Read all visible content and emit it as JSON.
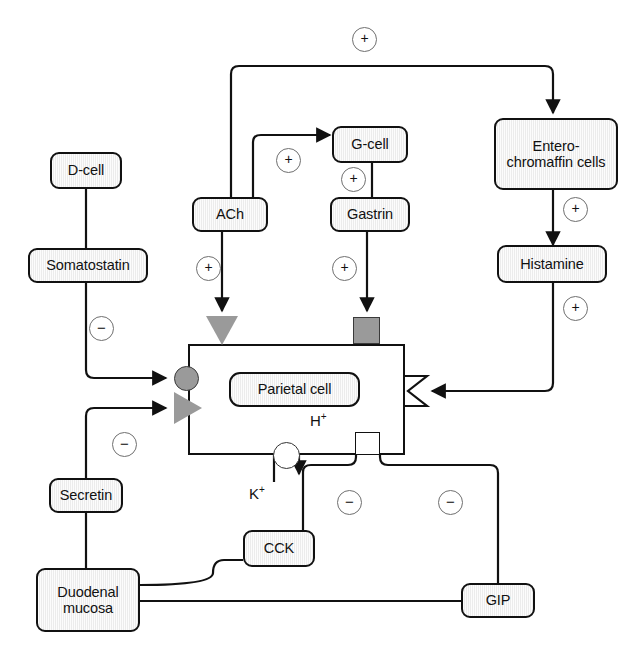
{
  "diagram": {
    "nodes": {
      "d_cell": "D-cell",
      "somatostatin": "Somatostatin",
      "ach": "ACh",
      "g_cell": "G-cell",
      "gastrin": "Gastrin",
      "enterochromaffin": "Entero-\nchromaffin cells",
      "enterochromaffin_line1": "Entero-",
      "enterochromaffin_line2": "chromaffin cells",
      "histamine": "Histamine",
      "parietal_cell": "Parietal cell",
      "secretin": "Secretin",
      "duodenal_line1": "Duodenal",
      "duodenal_line2": "mucosa",
      "cck": "CCK",
      "gip": "GIP"
    },
    "ions": {
      "hydrogen": "H",
      "hydrogen_charge": "+",
      "potassium": "K",
      "potassium_charge": "+"
    },
    "signs": {
      "plus": "+",
      "minus": "−"
    },
    "edges": [
      {
        "id": "ach-to-ec",
        "from": "ACh",
        "to": "Entero-chromaffin cells",
        "sign": "+"
      },
      {
        "id": "ach-to-gcell",
        "from": "ACh",
        "to": "G-cell",
        "sign": "+"
      },
      {
        "id": "gcell-to-gastrin",
        "from": "G-cell",
        "to": "Gastrin",
        "sign": "+"
      },
      {
        "id": "ach-to-parietal",
        "from": "ACh",
        "to": "Parietal cell",
        "sign": "+"
      },
      {
        "id": "gastrin-to-parietal",
        "from": "Gastrin",
        "to": "Parietal cell",
        "sign": "+"
      },
      {
        "id": "ec-to-histamine",
        "from": "Entero-chromaffin cells",
        "to": "Histamine",
        "sign": "+"
      },
      {
        "id": "histamine-to-parietal",
        "from": "Histamine",
        "to": "Parietal cell",
        "sign": "+"
      },
      {
        "id": "dcell-to-somatostatin",
        "from": "D-cell",
        "to": "Somatostatin",
        "sign": ""
      },
      {
        "id": "somatostatin-to-parietal",
        "from": "Somatostatin",
        "to": "Parietal cell",
        "sign": "−"
      },
      {
        "id": "secretin-to-parietal",
        "from": "Secretin",
        "to": "Parietal cell",
        "sign": "−"
      },
      {
        "id": "duodenum-to-secretin",
        "from": "Duodenal mucosa",
        "to": "Secretin",
        "sign": ""
      },
      {
        "id": "duodenum-to-cck",
        "from": "Duodenal mucosa",
        "to": "CCK",
        "sign": ""
      },
      {
        "id": "duodenum-to-gip",
        "from": "Duodenal mucosa",
        "to": "GIP",
        "sign": ""
      },
      {
        "id": "cck-to-pump",
        "from": "CCK",
        "to": "Parietal cell",
        "sign": "−"
      },
      {
        "id": "gip-to-pump",
        "from": "GIP",
        "to": "Parietal cell",
        "sign": "−"
      }
    ],
    "sign_markers": [
      {
        "id": "plus-top",
        "label": "+",
        "x": 352,
        "y": 27
      },
      {
        "id": "plus-ach-gcell",
        "label": "+",
        "x": 276,
        "y": 148
      },
      {
        "id": "plus-gcell-gast",
        "label": "+",
        "x": 341,
        "y": 167
      },
      {
        "id": "plus-ach-cell",
        "label": "+",
        "x": 196,
        "y": 256
      },
      {
        "id": "plus-gast-cell",
        "label": "+",
        "x": 332,
        "y": 256
      },
      {
        "id": "plus-ec-hist",
        "label": "+",
        "x": 563,
        "y": 197
      },
      {
        "id": "plus-hist-cell",
        "label": "+",
        "x": 563,
        "y": 296
      },
      {
        "id": "minus-somato",
        "label": "−",
        "x": 89,
        "y": 316
      },
      {
        "id": "minus-secretin",
        "label": "−",
        "x": 112,
        "y": 432
      },
      {
        "id": "minus-cck",
        "label": "−",
        "x": 337,
        "y": 490
      },
      {
        "id": "minus-gip",
        "label": "−",
        "x": 438,
        "y": 490
      }
    ],
    "receptors": [
      {
        "id": "ach-receptor",
        "shape": "triangle-down",
        "x": 206,
        "y": 316
      },
      {
        "id": "gastrin-receptor",
        "shape": "square",
        "x": 353,
        "y": 317
      },
      {
        "id": "somatostatin-receptor",
        "shape": "circle",
        "x": 174,
        "y": 366
      },
      {
        "id": "secretin-receptor",
        "shape": "triangle-right",
        "x": 174,
        "y": 397
      },
      {
        "id": "histamine-receptor",
        "shape": "notch",
        "x": 405,
        "y": 376
      },
      {
        "id": "proton-pump",
        "shape": "pump-circle",
        "x": 281,
        "y": 443
      },
      {
        "id": "pump-inhibition-site",
        "shape": "white-box",
        "x": 355,
        "y": 443
      }
    ]
  }
}
